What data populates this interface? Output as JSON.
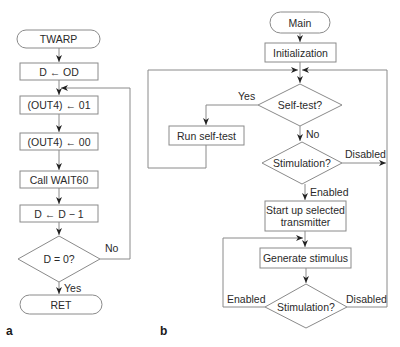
{
  "colors": {
    "stroke": "#8a8a8a",
    "text": "#2a2a2a",
    "background": "#ffffff"
  },
  "panel_a": {
    "label": "a",
    "start": "TWARP",
    "steps": [
      "D ← OD",
      "(OUT4) ← 01",
      "(OUT4) ← 00",
      "Call WAIT60",
      "D ← D  − 1"
    ],
    "decision": "D = 0?",
    "yes_label": "Yes",
    "no_label": "No",
    "end": "RET"
  },
  "panel_b": {
    "label": "b",
    "start": "Main",
    "init": "Initialization",
    "selftest_decision": "Self-test?",
    "selftest_yes": "Yes",
    "selftest_no": "No",
    "run_selftest": "Run self-test",
    "stim_decision_1": "Stimulation?",
    "stim1_disabled": "Disabled",
    "stim1_enabled": "Enabled",
    "startup_line1": "Start up selected",
    "startup_line2": "transmitter",
    "generate": "Generate stimulus",
    "stim_decision_2": "Stimulation?",
    "stim2_enabled": "Enabled",
    "stim2_disabled": "Disabled"
  }
}
